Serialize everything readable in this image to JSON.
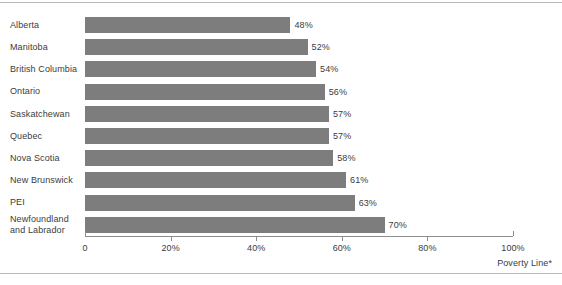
{
  "chart_data": {
    "type": "bar",
    "orientation": "horizontal",
    "title": "",
    "subtitle": "",
    "xlabel": "Poverty Line*",
    "ylabel": "",
    "xlim": [
      0,
      100
    ],
    "grid": false,
    "legend": null,
    "legend_position": "none",
    "categories": [
      "Alberta",
      "Manitoba",
      "British Columbia",
      "Ontario",
      "Saskatchewan",
      "Quebec",
      "Nova Scotia",
      "New Brunswick",
      "PEI",
      "Newfoundland\nand Labrador"
    ],
    "values": [
      48,
      52,
      54,
      56,
      57,
      57,
      58,
      61,
      63,
      70
    ],
    "value_labels": [
      "48%",
      "52%",
      "54%",
      "56%",
      "57%",
      "57%",
      "58%",
      "61%",
      "63%",
      "70%"
    ],
    "xticks": [
      0,
      20,
      40,
      60,
      80,
      100
    ],
    "xtick_labels": [
      "0",
      "20%",
      "40%",
      "60%",
      "80%",
      "100%"
    ],
    "bar_color": "#7d7d7d",
    "text_color": "#3c3c3c",
    "axis_color": "#8d8d8d",
    "rule_color": "#b9b9b9",
    "background": "#ffffff"
  }
}
